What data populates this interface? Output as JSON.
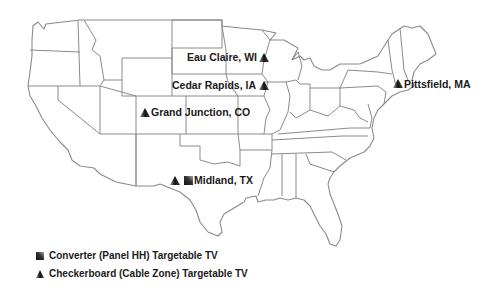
{
  "map": {
    "region": "Contiguous United States",
    "colors": {
      "background": "#ffffff",
      "state_fill": "#ffffff",
      "state_border": "#8a8a8a",
      "text": "#1a1a1a",
      "marker": "#222222"
    }
  },
  "locations": [
    {
      "name": "Eau Claire, WI",
      "markers": [
        "checkerboard"
      ]
    },
    {
      "name": "Cedar Rapids, IA",
      "markers": [
        "checkerboard"
      ]
    },
    {
      "name": "Grand Junction, CO",
      "markers": [
        "checkerboard"
      ]
    },
    {
      "name": "Midland, TX",
      "markers": [
        "checkerboard",
        "converter"
      ]
    },
    {
      "name": "Pittsfield, MA",
      "markers": [
        "checkerboard"
      ]
    }
  ],
  "legend": {
    "items": [
      {
        "icon": "converter-square-icon",
        "label": "Converter (Panel HH) Targetable TV"
      },
      {
        "icon": "checkerboard-triangle-icon",
        "label": "Checkerboard (Cable Zone) Targetable TV"
      }
    ]
  }
}
